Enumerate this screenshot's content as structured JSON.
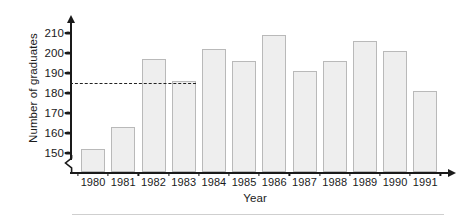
{
  "chart_data": {
    "type": "bar",
    "title": "",
    "xlabel": "Year",
    "ylabel": "Number of graduates",
    "categories": [
      "1980",
      "1981",
      "1982",
      "1983",
      "1984",
      "1985",
      "1986",
      "1987",
      "1988",
      "1989",
      "1990",
      "1991"
    ],
    "values": [
      152,
      163,
      197,
      186,
      202,
      196,
      209,
      191,
      196,
      206,
      201,
      181
    ],
    "ylim": [
      145,
      213
    ],
    "y_ticks": [
      150,
      160,
      170,
      180,
      190,
      200,
      210
    ],
    "y_tick_labels": [
      "150",
      "160",
      "170",
      "180",
      "190",
      "200",
      "210"
    ],
    "grid": false,
    "legend": "none",
    "axis_break": true,
    "annotations": [
      {
        "name": "reference-line",
        "type": "horizontal-dashed-line",
        "value": 185,
        "style": "dashed",
        "color": "#222222"
      }
    ],
    "bar_fill_color": "#eeeeee",
    "bar_border_color": "#b9b9b9",
    "axis_color": "#1a1a1a"
  }
}
